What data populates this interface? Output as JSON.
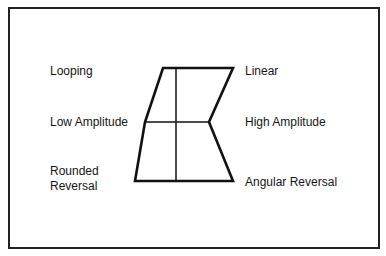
{
  "diagram": {
    "left_labels": {
      "top": "Looping",
      "middle": "Low Amplitude",
      "bottom_line1": "Rounded",
      "bottom_line2": "Reversal"
    },
    "right_labels": {
      "top": "Linear",
      "middle": "High Amplitude",
      "bottom": "Angular Reversal"
    },
    "shape": {
      "description": "Quadrilateral divided into quadrants by a vertical and horizontal line; left side bends outward, right side has an inward notch at mid height",
      "vertices": {
        "top_left": [
          163,
          68
        ],
        "top_right": [
          233,
          68
        ],
        "mid_right": [
          209,
          122
        ],
        "bottom_right": [
          233,
          181
        ],
        "bottom_left": [
          135,
          181
        ],
        "mid_left": [
          145,
          122
        ]
      },
      "divider_x": 176,
      "stroke_color": "#111111"
    }
  }
}
